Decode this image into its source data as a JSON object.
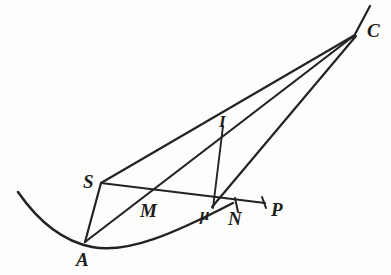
{
  "figure": {
    "background_color": "#fdfdfc",
    "ink_color": "#232323",
    "points": [
      {
        "id": "A",
        "label": "A",
        "x": 85,
        "y": 242,
        "label_x": 76,
        "label_y": 250
      },
      {
        "id": "S",
        "label": "S",
        "x": 101,
        "y": 183,
        "label_x": 83,
        "label_y": 172
      },
      {
        "id": "M",
        "label": "M",
        "x": 146,
        "y": 196,
        "label_x": 142,
        "label_y": 201
      },
      {
        "id": "I",
        "label": "I",
        "x": 223,
        "y": 128,
        "label_x": 218,
        "label_y": 114
      },
      {
        "id": "mu",
        "label": "μ",
        "x": 212,
        "y": 207,
        "label_x": 203,
        "label_y": 208
      },
      {
        "id": "N",
        "label": "N",
        "x": 236,
        "y": 206,
        "label_x": 230,
        "label_y": 211
      },
      {
        "id": "P",
        "label": "P",
        "x": 266,
        "y": 203,
        "label_x": 272,
        "label_y": 201
      },
      {
        "id": "C",
        "label": "C",
        "x": 355,
        "y": 35,
        "label_x": 368,
        "label_y": 22
      }
    ],
    "segments": [
      {
        "id": "S-C",
        "from": "S",
        "to": "C",
        "kind": "line"
      },
      {
        "id": "A-C",
        "from": "A",
        "to": "C",
        "kind": "line"
      },
      {
        "id": "mu-C",
        "from": "mu",
        "to": "C",
        "kind": "line"
      },
      {
        "id": "A-S",
        "from": "A",
        "to": "S",
        "kind": "line"
      },
      {
        "id": "S-P",
        "from": "S",
        "to": "P",
        "kind": "line"
      },
      {
        "id": "I-mu",
        "from": "I",
        "to": "mu",
        "kind": "line"
      }
    ],
    "curve": {
      "id": "parabola-arc",
      "description": "parabolic arc through A and mu",
      "start": {
        "x": 18,
        "y": 192
      },
      "end": {
        "x": 233,
        "y": 203
      },
      "vertex": {
        "x": 92,
        "y": 248
      }
    },
    "tick_marks": [
      {
        "id": "tick-N",
        "x": 236,
        "y": 206
      },
      {
        "id": "tick-P-end",
        "x": 264,
        "y": 203
      }
    ],
    "extension": {
      "id": "C-extension",
      "description": "line continuing beyond C toward upper right",
      "to": {
        "x": 370,
        "y": 6
      }
    }
  }
}
